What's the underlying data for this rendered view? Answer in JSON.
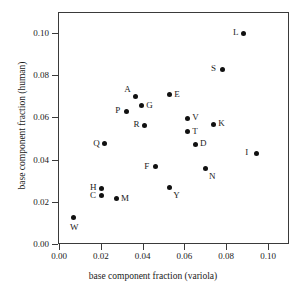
{
  "chart_data": {
    "type": "scatter",
    "title": "",
    "xlabel": "base component fraction (variola)",
    "ylabel": "base component fraction (human)",
    "xlim": [
      0.0,
      0.11
    ],
    "ylim": [
      0.0,
      0.111
    ],
    "grid": false,
    "legend": "none",
    "xticks": [
      "0.00",
      "0.02",
      "0.04",
      "0.06",
      "0.08",
      "0.10"
    ],
    "xtick_values": [
      0.0,
      0.02,
      0.04,
      0.06,
      0.08,
      0.1
    ],
    "yticks": [
      "0.00",
      "0.02",
      "0.04",
      "0.06",
      "0.08",
      "0.10"
    ],
    "ytick_values": [
      0.0,
      0.02,
      0.04,
      0.06,
      0.08,
      0.1
    ],
    "points": [
      {
        "label": "L",
        "x": 0.0885,
        "y": 0.1,
        "label_pos": "left"
      },
      {
        "label": "S",
        "x": 0.078,
        "y": 0.0828,
        "label_pos": "left"
      },
      {
        "label": "A",
        "x": 0.0365,
        "y": 0.0701,
        "label_pos": "topleft"
      },
      {
        "label": "E",
        "x": 0.0528,
        "y": 0.0708,
        "label_pos": "right"
      },
      {
        "label": "G",
        "x": 0.0393,
        "y": 0.0656,
        "label_pos": "right"
      },
      {
        "label": "P",
        "x": 0.0322,
        "y": 0.0629,
        "label_pos": "left"
      },
      {
        "label": "V",
        "x": 0.0614,
        "y": 0.0597,
        "label_pos": "right"
      },
      {
        "label": "K",
        "x": 0.0738,
        "y": 0.0568,
        "label_pos": "right"
      },
      {
        "label": "R",
        "x": 0.0409,
        "y": 0.0563,
        "label_pos": "left"
      },
      {
        "label": "T",
        "x": 0.0614,
        "y": 0.0532,
        "label_pos": "right"
      },
      {
        "label": "Q",
        "x": 0.0216,
        "y": 0.0474,
        "label_pos": "left"
      },
      {
        "label": "D",
        "x": 0.0651,
        "y": 0.0472,
        "label_pos": "right"
      },
      {
        "label": "I",
        "x": 0.0944,
        "y": 0.043,
        "label_pos": "left"
      },
      {
        "label": "F",
        "x": 0.046,
        "y": 0.0366,
        "label_pos": "left"
      },
      {
        "label": "N",
        "x": 0.0699,
        "y": 0.036,
        "label_pos": "bottomright"
      },
      {
        "label": "Y",
        "x": 0.0528,
        "y": 0.0268,
        "label_pos": "bottomright"
      },
      {
        "label": "H",
        "x": 0.0201,
        "y": 0.0264,
        "label_pos": "left"
      },
      {
        "label": "C",
        "x": 0.0201,
        "y": 0.0228,
        "label_pos": "left"
      },
      {
        "label": "M",
        "x": 0.0273,
        "y": 0.0214,
        "label_pos": "right"
      },
      {
        "label": "W",
        "x": 0.0067,
        "y": 0.0125,
        "label_pos": "bottom"
      }
    ]
  }
}
